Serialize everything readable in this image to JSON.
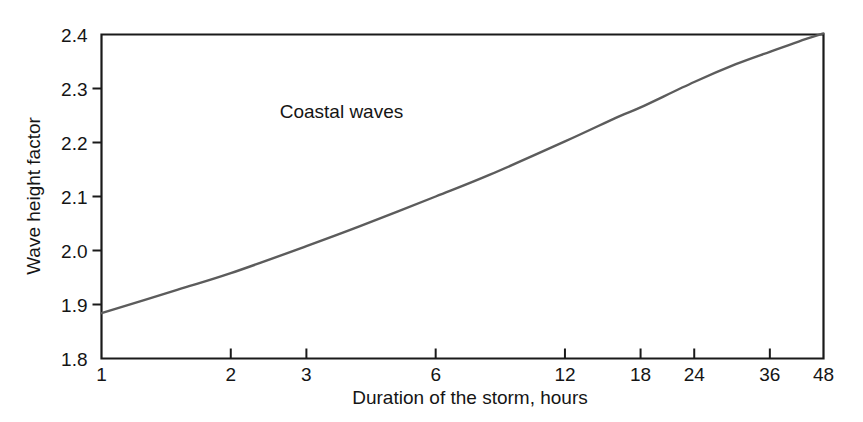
{
  "chart_data": {
    "type": "line",
    "title": "",
    "subtitle": "",
    "xlabel": "Duration of the storm, hours",
    "ylabel": "Wave height factor",
    "xscale": "log",
    "yscale": "linear",
    "xlim": [
      1,
      48
    ],
    "ylim": [
      1.8,
      2.4
    ],
    "grid": false,
    "legend": null,
    "xticks": [
      1,
      2,
      3,
      6,
      12,
      18,
      24,
      36,
      48
    ],
    "xtick_labels": [
      "1",
      "2",
      "3",
      "6",
      "12",
      "18",
      "24",
      "36",
      "48"
    ],
    "yticks": [
      1.8,
      1.9,
      2.0,
      2.1,
      2.2,
      2.3,
      2.4
    ],
    "ytick_labels": [
      "1.8",
      "1.9",
      "2.0",
      "2.1",
      "2.2",
      "2.3",
      "2.4"
    ],
    "annotations": [
      {
        "text": "Coastal waves",
        "x": 2.6,
        "y": 2.245
      }
    ],
    "series": [
      {
        "name": "Coastal waves",
        "color": "#5c5c5c",
        "x": [
          1,
          1.5,
          2,
          3,
          4,
          6,
          8,
          12,
          16,
          18,
          24,
          30,
          36,
          42,
          48
        ],
        "values": [
          1.884,
          1.927,
          1.958,
          2.008,
          2.045,
          2.1,
          2.14,
          2.202,
          2.248,
          2.265,
          2.312,
          2.345,
          2.368,
          2.387,
          2.402
        ]
      }
    ]
  },
  "axis_titles": {
    "x": "Duration of the storm, hours",
    "y": "Wave height factor"
  },
  "colors": {
    "background": "#ffffff",
    "axis": "#1a1a1a",
    "curve": "#5c5c5c",
    "text": "#151515"
  }
}
